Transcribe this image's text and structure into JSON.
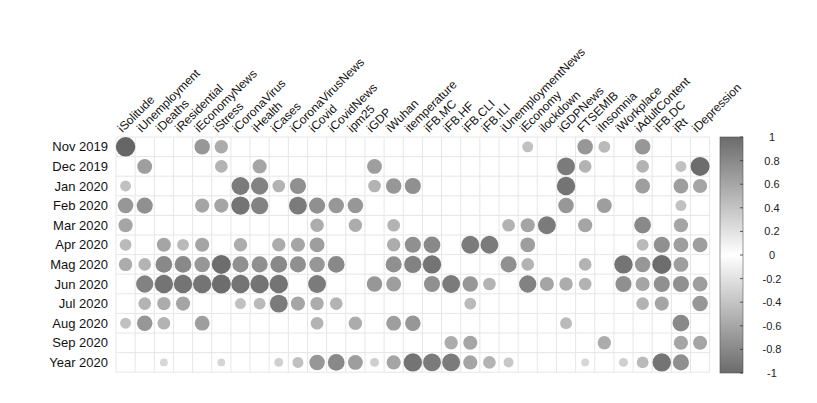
{
  "chart_data": {
    "type": "heatmap",
    "subtype": "correlation-circle-matrix",
    "title": "",
    "rows": [
      "Nov 2019",
      "Dec 2019",
      "Jan 2020",
      "Feb 2020",
      "Mar 2020",
      "Apr 2020",
      "Mag 2020",
      "Jun 2020",
      "Jul 2020",
      "Aug 2020",
      "Sep 2020",
      "Year 2020"
    ],
    "columns": [
      "iSolitude",
      "iUnemployment",
      "iDeaths",
      "iResidential",
      "iEconomyNews",
      "iStress",
      "iCoronaVirus",
      "iHealth",
      "iCases",
      "iCoronaVirusNews",
      "iCovid",
      "iCovidNews",
      "ipm25",
      "iGDP",
      "iWuhan",
      "itemperature",
      "iFB.MC",
      "iFB.HF",
      "iFB.CLI",
      "iFB.ILI",
      "iUnemploymentNews",
      "iEconomy",
      "ilockdown",
      "iGDPNews",
      "FTSEMIB",
      "iInsomnia",
      "iWorkplace",
      "iAdultContent",
      "iFB.DC",
      "iRt",
      "iDepression"
    ],
    "colorbar": {
      "ticks": [
        "1",
        "0.8",
        "0.6",
        "0.4",
        "0.2",
        "0",
        "-0.2",
        "-0.4",
        "-0.6",
        "-0.8",
        "-1"
      ],
      "range": [
        -1,
        1
      ],
      "colors": {
        "high": "#6b6b6b",
        "mid": "#ffffff",
        "low": "#6b6b6b"
      }
    },
    "cells": [
      [
        0,
        0,
        0.95
      ],
      [
        0,
        4,
        0.6
      ],
      [
        0,
        5,
        0.45
      ],
      [
        0,
        21,
        0.3
      ],
      [
        0,
        24,
        0.6
      ],
      [
        0,
        25,
        0.35
      ],
      [
        0,
        27,
        0.6
      ],
      [
        1,
        1,
        0.55
      ],
      [
        1,
        5,
        0.4
      ],
      [
        1,
        7,
        0.5
      ],
      [
        1,
        13,
        0.55
      ],
      [
        1,
        23,
        0.8
      ],
      [
        1,
        24,
        0.4
      ],
      [
        1,
        27,
        0.4
      ],
      [
        1,
        29,
        0.3
      ],
      [
        1,
        30,
        0.9
      ],
      [
        2,
        0,
        0.3
      ],
      [
        2,
        6,
        0.8
      ],
      [
        2,
        7,
        0.75
      ],
      [
        2,
        8,
        0.4
      ],
      [
        2,
        9,
        0.65
      ],
      [
        2,
        13,
        0.4
      ],
      [
        2,
        14,
        0.6
      ],
      [
        2,
        15,
        0.65
      ],
      [
        2,
        23,
        0.85
      ],
      [
        2,
        27,
        0.55
      ],
      [
        2,
        29,
        0.55
      ],
      [
        2,
        30,
        0.5
      ],
      [
        3,
        0,
        0.6
      ],
      [
        3,
        1,
        0.65
      ],
      [
        3,
        4,
        0.5
      ],
      [
        3,
        5,
        0.5
      ],
      [
        3,
        6,
        0.85
      ],
      [
        3,
        7,
        0.75
      ],
      [
        3,
        9,
        0.8
      ],
      [
        3,
        10,
        0.65
      ],
      [
        3,
        11,
        0.6
      ],
      [
        3,
        12,
        0.6
      ],
      [
        3,
        23,
        0.6
      ],
      [
        3,
        25,
        0.55
      ],
      [
        3,
        29,
        0.3
      ],
      [
        4,
        0,
        0.5
      ],
      [
        4,
        10,
        0.45
      ],
      [
        4,
        12,
        0.45
      ],
      [
        4,
        14,
        0.4
      ],
      [
        4,
        20,
        0.4
      ],
      [
        4,
        21,
        0.5
      ],
      [
        4,
        22,
        0.8
      ],
      [
        4,
        24,
        0.5
      ],
      [
        4,
        27,
        0.7
      ],
      [
        4,
        29,
        0.5
      ],
      [
        5,
        0,
        0.35
      ],
      [
        5,
        2,
        0.5
      ],
      [
        5,
        3,
        0.35
      ],
      [
        5,
        4,
        0.5
      ],
      [
        5,
        6,
        0.45
      ],
      [
        5,
        8,
        0.45
      ],
      [
        5,
        9,
        0.5
      ],
      [
        5,
        10,
        0.55
      ],
      [
        5,
        14,
        0.45
      ],
      [
        5,
        15,
        0.65
      ],
      [
        5,
        16,
        0.7
      ],
      [
        5,
        18,
        0.8
      ],
      [
        5,
        19,
        0.8
      ],
      [
        5,
        21,
        0.55
      ],
      [
        5,
        27,
        0.35
      ],
      [
        5,
        28,
        0.65
      ],
      [
        5,
        29,
        0.55
      ],
      [
        5,
        30,
        0.55
      ],
      [
        6,
        0,
        0.45
      ],
      [
        6,
        1,
        0.4
      ],
      [
        6,
        2,
        0.7
      ],
      [
        6,
        3,
        0.7
      ],
      [
        6,
        4,
        0.6
      ],
      [
        6,
        5,
        0.9
      ],
      [
        6,
        6,
        0.65
      ],
      [
        6,
        7,
        0.65
      ],
      [
        6,
        8,
        0.7
      ],
      [
        6,
        9,
        0.65
      ],
      [
        6,
        10,
        0.6
      ],
      [
        6,
        11,
        0.7
      ],
      [
        6,
        14,
        0.65
      ],
      [
        6,
        15,
        0.75
      ],
      [
        6,
        16,
        0.85
      ],
      [
        6,
        20,
        0.65
      ],
      [
        6,
        21,
        0.4
      ],
      [
        6,
        24,
        0.4
      ],
      [
        6,
        26,
        0.85
      ],
      [
        6,
        27,
        0.6
      ],
      [
        6,
        28,
        0.9
      ],
      [
        6,
        29,
        0.55
      ],
      [
        7,
        1,
        0.75
      ],
      [
        7,
        2,
        0.85
      ],
      [
        7,
        3,
        0.85
      ],
      [
        7,
        4,
        0.85
      ],
      [
        7,
        5,
        0.9
      ],
      [
        7,
        6,
        0.85
      ],
      [
        7,
        7,
        0.85
      ],
      [
        7,
        8,
        0.85
      ],
      [
        7,
        10,
        0.8
      ],
      [
        7,
        13,
        0.6
      ],
      [
        7,
        14,
        0.55
      ],
      [
        7,
        16,
        0.65
      ],
      [
        7,
        17,
        0.8
      ],
      [
        7,
        18,
        0.6
      ],
      [
        7,
        19,
        0.4
      ],
      [
        7,
        21,
        0.75
      ],
      [
        7,
        22,
        0.5
      ],
      [
        7,
        23,
        0.45
      ],
      [
        7,
        24,
        0.4
      ],
      [
        7,
        26,
        0.65
      ],
      [
        7,
        27,
        0.5
      ],
      [
        7,
        28,
        0.65
      ],
      [
        7,
        29,
        0.65
      ],
      [
        7,
        30,
        0.55
      ],
      [
        8,
        1,
        0.4
      ],
      [
        8,
        2,
        0.45
      ],
      [
        8,
        3,
        0.5
      ],
      [
        8,
        6,
        0.3
      ],
      [
        8,
        7,
        0.35
      ],
      [
        8,
        8,
        0.8
      ],
      [
        8,
        9,
        0.5
      ],
      [
        8,
        10,
        0.45
      ],
      [
        8,
        11,
        0.4
      ],
      [
        8,
        18,
        0.35
      ],
      [
        8,
        27,
        0.4
      ],
      [
        8,
        28,
        0.5
      ],
      [
        8,
        30,
        0.6
      ],
      [
        9,
        0,
        0.3
      ],
      [
        9,
        1,
        0.6
      ],
      [
        9,
        2,
        0.4
      ],
      [
        9,
        4,
        0.55
      ],
      [
        9,
        10,
        0.4
      ],
      [
        9,
        12,
        0.45
      ],
      [
        9,
        14,
        0.55
      ],
      [
        9,
        15,
        0.6
      ],
      [
        9,
        23,
        0.35
      ],
      [
        9,
        29,
        0.7
      ],
      [
        10,
        17,
        0.45
      ],
      [
        10,
        18,
        0.5
      ],
      [
        10,
        25,
        0.45
      ],
      [
        10,
        29,
        0.5
      ],
      [
        10,
        30,
        0.5
      ],
      [
        11,
        2,
        0.15
      ],
      [
        11,
        5,
        0.15
      ],
      [
        11,
        8,
        0.2
      ],
      [
        11,
        9,
        0.3
      ],
      [
        11,
        10,
        0.6
      ],
      [
        11,
        11,
        0.7
      ],
      [
        11,
        12,
        0.55
      ],
      [
        11,
        13,
        0.2
      ],
      [
        11,
        14,
        0.5
      ],
      [
        11,
        15,
        0.85
      ],
      [
        11,
        16,
        0.8
      ],
      [
        11,
        17,
        0.8
      ],
      [
        11,
        18,
        0.5
      ],
      [
        11,
        19,
        0.4
      ],
      [
        11,
        20,
        0.25
      ],
      [
        11,
        24,
        0.15
      ],
      [
        11,
        26,
        0.2
      ],
      [
        11,
        27,
        0.35
      ],
      [
        11,
        28,
        0.85
      ],
      [
        11,
        29,
        0.65
      ]
    ],
    "xlabel": "",
    "ylabel": "",
    "grid": true,
    "legend_position": "right (colorbar)"
  }
}
